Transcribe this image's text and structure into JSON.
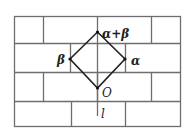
{
  "diagram": {
    "type": "brick-lattice-rhombus",
    "colors": {
      "grid": "#6e6e6e",
      "rhombus": "#222222",
      "background": "#ffffff"
    },
    "labels": {
      "top": "α+β",
      "right": "α",
      "left": "β",
      "origin": "O",
      "line": "l"
    },
    "grid": {
      "outer": {
        "x1": 14,
        "y1": 16,
        "x2": 180,
        "y2": 126
      },
      "row_lines": [
        43,
        72,
        101
      ],
      "rows": [
        {
          "y1": 16,
          "y2": 43,
          "verticals": [
            43,
            97,
            151
          ]
        },
        {
          "y1": 43,
          "y2": 72,
          "verticals": [
            70,
            125
          ]
        },
        {
          "y1": 72,
          "y2": 101,
          "verticals": [
            43,
            97,
            151
          ]
        },
        {
          "y1": 101,
          "y2": 126,
          "verticals": [
            71,
            125
          ]
        }
      ]
    },
    "rhombus": {
      "top": [
        97,
        32
      ],
      "right": [
        125,
        59
      ],
      "bottom": [
        97,
        88
      ],
      "left": [
        70,
        59
      ]
    },
    "axis_l": {
      "x": 97,
      "y1": 88,
      "y2": 116
    }
  }
}
